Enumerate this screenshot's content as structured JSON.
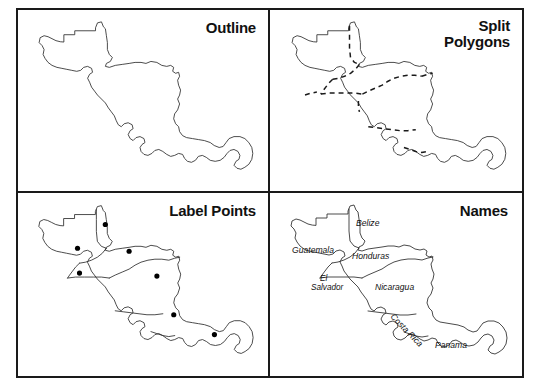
{
  "figure": {
    "background_color": "#ffffff",
    "border_color": "#1a1a1a",
    "line_color": "#2b2b2b",
    "panel_count": 4
  },
  "panels": [
    {
      "id": "outline",
      "title": "Outline",
      "position": "top-left",
      "description": "Single merged outline of Central America with no internal boundaries"
    },
    {
      "id": "split-polygons",
      "title": "Split\nPolygons",
      "position": "top-right",
      "description": "Central America outline with dashed internal country boundaries"
    },
    {
      "id": "label-points",
      "title": "Label Points",
      "position": "bottom-left",
      "description": "Country polygons with a solid black label point inside each country"
    },
    {
      "id": "names",
      "title": "Names",
      "position": "bottom-right",
      "description": "Country polygons annotated with italic country name labels"
    }
  ],
  "label_points": [
    {
      "country": "Belize",
      "x": 88,
      "y": 31
    },
    {
      "country": "Guatemala",
      "x": 60,
      "y": 55
    },
    {
      "country": "El Salvador",
      "x": 62,
      "y": 80
    },
    {
      "country": "Honduras",
      "x": 112,
      "y": 58
    },
    {
      "country": "Nicaragua",
      "x": 140,
      "y": 83
    },
    {
      "country": "Costa Rica",
      "x": 157,
      "y": 122
    },
    {
      "country": "Panama",
      "x": 198,
      "y": 142
    }
  ],
  "country_names": [
    {
      "name": "Belize",
      "x": 86,
      "y": 33,
      "rotation": 0,
      "anchor": "start"
    },
    {
      "name": "Guatemala",
      "x": 22,
      "y": 60,
      "rotation": 0,
      "anchor": "start"
    },
    {
      "name": "Honduras",
      "x": 82,
      "y": 66,
      "rotation": 0,
      "anchor": "start"
    },
    {
      "name": "El Salvador",
      "x": 47,
      "y": 92,
      "rotation": 0,
      "anchor": "start"
    },
    {
      "name": "Nicaragua",
      "x": 105,
      "y": 97,
      "rotation": 0,
      "anchor": "start"
    },
    {
      "name": "Costa Rica",
      "x": 120,
      "y": 124,
      "rotation": 46,
      "anchor": "start"
    },
    {
      "name": "Panama",
      "x": 165,
      "y": 155,
      "rotation": 0,
      "anchor": "start"
    }
  ],
  "chart_data": {
    "type": "map",
    "region": "Central America",
    "countries": [
      "Belize",
      "Guatemala",
      "El Salvador",
      "Honduras",
      "Nicaragua",
      "Costa Rica",
      "Panama"
    ],
    "panel_titles": [
      "Outline",
      "Split Polygons",
      "Label Points",
      "Names"
    ],
    "legend": "none",
    "grid": "2x2"
  }
}
